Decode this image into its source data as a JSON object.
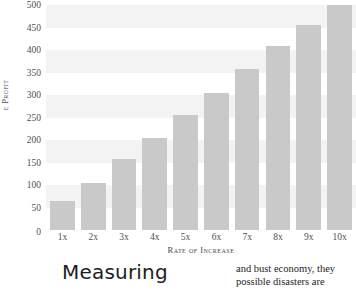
{
  "chart_data": {
    "type": "bar",
    "title": "",
    "subtitle": "",
    "xlabel": "Rate of Increase",
    "ylabel": "e Profit",
    "categories": [
      "1x",
      "2x",
      "3x",
      "4x",
      "5x",
      "6x",
      "7x",
      "8x",
      "9x",
      "10x"
    ],
    "values": [
      65,
      105,
      158,
      205,
      255,
      305,
      358,
      408,
      455,
      500
    ],
    "ylim": [
      0,
      500
    ],
    "yticks": [
      0,
      50,
      100,
      150,
      200,
      250,
      300,
      350,
      400,
      450,
      500
    ],
    "ytick_labels": [
      "0",
      "50",
      "100",
      "150",
      "200",
      "250",
      "300",
      "350",
      "400",
      "450",
      "500"
    ],
    "grid": "horizontal-bands",
    "legend": "none",
    "bar_color": "#c9c9c9",
    "band_color": "#f3f3f3",
    "background": "#ffffff"
  },
  "article": {
    "headline": "Measuring",
    "column_lines": [
      "and bust economy, they",
      "possible disasters are"
    ]
  }
}
